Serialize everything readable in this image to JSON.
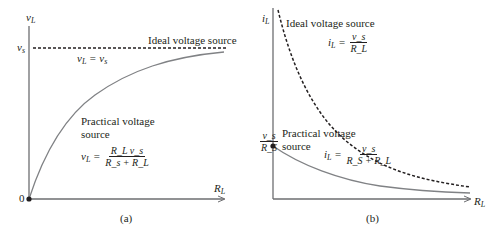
{
  "panel_a": {
    "caption": "(a)",
    "y_axis_label": "v",
    "y_axis_sub": "L",
    "x_axis_label": "R",
    "x_axis_sub": "L",
    "origin_label": "0",
    "vs_tick_label": "v",
    "vs_tick_sub": "s",
    "ideal_label": "Ideal voltage source",
    "ideal_eq": "v_L = v_s",
    "ideal_eq_lhs": "v",
    "ideal_eq_lhs_sub": "L",
    "ideal_eq_rhs": "v",
    "ideal_eq_rhs_sub": "s",
    "practical_label_line1": "Practical voltage",
    "practical_label_line2": "source",
    "practical_eq_lhs": "v",
    "practical_eq_lhs_sub": "L",
    "practical_eq_num": "R_L v_s",
    "practical_eq_den": "R_s + R_L"
  },
  "panel_b": {
    "caption": "(b)",
    "y_axis_label": "i",
    "y_axis_sub": "L",
    "x_axis_label": "R",
    "x_axis_sub": "L",
    "intercept_num": "v_s",
    "intercept_den": "R_S",
    "ideal_label": "Ideal voltage source",
    "ideal_eq_lhs": "i",
    "ideal_eq_lhs_sub": "L",
    "ideal_eq_num": "v_s",
    "ideal_eq_den": "R_L",
    "practical_label_line1": "Practical voltage",
    "practical_label_line2": "source",
    "practical_eq_lhs": "i",
    "practical_eq_lhs_sub": "L",
    "practical_eq_num": "v_s",
    "practical_eq_den": "R_S + R_L"
  },
  "colors": {
    "axis": "#6d6e71",
    "curve": "#808285",
    "dashed": "#231f20",
    "text": "#231f20"
  }
}
